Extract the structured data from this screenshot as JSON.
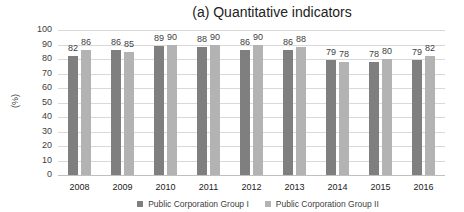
{
  "chart_data": {
    "type": "bar",
    "title": "(a) Quantitative indicators",
    "xlabel": "",
    "ylabel": "(%)",
    "ylim": [
      0,
      100
    ],
    "yticks": [
      0,
      10,
      20,
      30,
      40,
      50,
      60,
      70,
      80,
      90,
      100
    ],
    "grid": true,
    "legend_position": "bottom",
    "categories": [
      "2008",
      "2009",
      "2010",
      "2011",
      "2012",
      "2013",
      "2014",
      "2015",
      "2016"
    ],
    "series": [
      {
        "name": "Public Corporation Group I",
        "color": "#7f7f7f",
        "values": [
          82,
          86,
          89,
          88,
          86,
          86,
          79,
          78,
          79
        ]
      },
      {
        "name": "Public Corporation Group II",
        "color": "#b3b3b3",
        "values": [
          86,
          85,
          90,
          90,
          90,
          88,
          78,
          80,
          82
        ]
      }
    ]
  }
}
